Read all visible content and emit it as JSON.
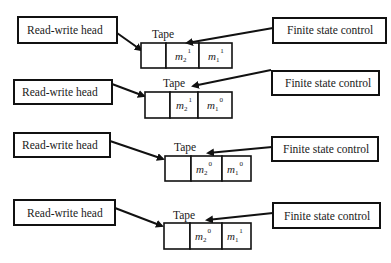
{
  "diagram": {
    "colors": {
      "stroke": "#111111",
      "background": "#ffffff",
      "text": "#1a1a1a"
    },
    "rows": [
      {
        "rw_label": "Read-write head",
        "fsc_label": "Finite state control",
        "tape_label": "Tape",
        "cells": [
          {
            "sym": "",
            "sub": "",
            "sup": ""
          },
          {
            "sym": "m",
            "sub": "2",
            "sup": "1"
          },
          {
            "sym": "m",
            "sub": "1",
            "sup": "1"
          }
        ]
      },
      {
        "rw_label": "Read-write head",
        "fsc_label": "Finite state control",
        "tape_label": "Tape",
        "cells": [
          {
            "sym": "",
            "sub": "",
            "sup": ""
          },
          {
            "sym": "m",
            "sub": "2",
            "sup": "1"
          },
          {
            "sym": "m",
            "sub": "1",
            "sup": "0"
          }
        ]
      },
      {
        "rw_label": "Read-write head",
        "fsc_label": "Finite state control",
        "tape_label": "Tape",
        "cells": [
          {
            "sym": "",
            "sub": "",
            "sup": ""
          },
          {
            "sym": "m",
            "sub": "2",
            "sup": "0"
          },
          {
            "sym": "m",
            "sub": "1",
            "sup": "0"
          }
        ]
      },
      {
        "rw_label": "Read-write head",
        "fsc_label": "Finite state control",
        "tape_label": "Tape",
        "cells": [
          {
            "sym": "",
            "sub": "",
            "sup": ""
          },
          {
            "sym": "m",
            "sub": "2",
            "sup": "0"
          },
          {
            "sym": "m",
            "sub": "1",
            "sup": "1"
          }
        ]
      }
    ]
  }
}
